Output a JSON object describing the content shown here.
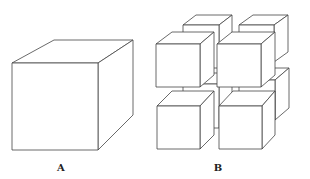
{
  "figure": {
    "panels": [
      {
        "id": "A",
        "label": "A",
        "description": "Single large cube",
        "label_pos": {
          "x": 61,
          "y": 166
        }
      },
      {
        "id": "B",
        "label": "B",
        "description": "Eight smaller cubes arranged in a 2x2x2 grid with gaps",
        "label_pos": {
          "x": 218,
          "y": 166
        }
      }
    ],
    "stroke_color": "#444444",
    "background": "#ffffff"
  }
}
